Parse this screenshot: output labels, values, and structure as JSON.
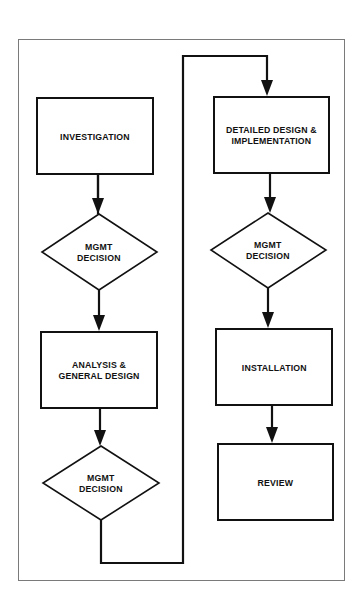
{
  "diagram": {
    "type": "flowchart",
    "left_column": [
      {
        "id": "investigation",
        "shape": "rectangle",
        "label": "INVESTIGATION"
      },
      {
        "id": "mgmt-decision-1",
        "shape": "diamond",
        "label": "MGMT\nDECISION"
      },
      {
        "id": "analysis",
        "shape": "rectangle",
        "label": "ANALYSIS &\nGENERAL DESIGN"
      },
      {
        "id": "mgmt-decision-2",
        "shape": "diamond",
        "label": "MGMT\nDECISION"
      }
    ],
    "right_column": [
      {
        "id": "detailed-design",
        "shape": "rectangle",
        "label": "DETAILED DESIGN &\nIMPLEMENTATION"
      },
      {
        "id": "mgmt-decision-3",
        "shape": "diamond",
        "label": "MGMT\nDECISION"
      },
      {
        "id": "installation",
        "shape": "rectangle",
        "label": "INSTALLATION"
      },
      {
        "id": "review",
        "shape": "rectangle",
        "label": "REVIEW"
      }
    ],
    "edges": [
      [
        "investigation",
        "mgmt-decision-1"
      ],
      [
        "mgmt-decision-1",
        "analysis"
      ],
      [
        "analysis",
        "mgmt-decision-2"
      ],
      [
        "mgmt-decision-2",
        "detailed-design"
      ],
      [
        "detailed-design",
        "mgmt-decision-3"
      ],
      [
        "mgmt-decision-3",
        "installation"
      ],
      [
        "installation",
        "review"
      ]
    ],
    "colors": {
      "line": "#111111",
      "frame": "#7a7a7a",
      "background": "#ffffff"
    }
  }
}
